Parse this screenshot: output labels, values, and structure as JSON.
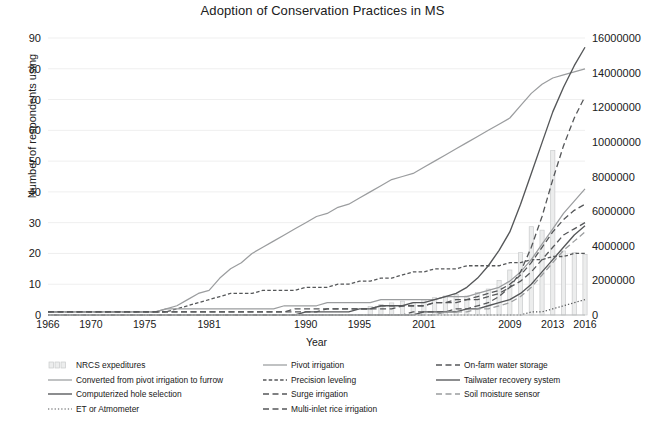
{
  "chart": {
    "title": "Adoption of Conservation Practices in MS",
    "xlabel": "Year",
    "ylabel_left": "Number of respondents using",
    "ylabel_right": ""
  },
  "axes": {
    "y_left_ticks": [
      "0",
      "10",
      "20",
      "30",
      "40",
      "50",
      "60",
      "70",
      "80",
      "90"
    ],
    "y_right_ticks": [
      "0",
      "2000000",
      "4000000",
      "6000000",
      "8000000",
      "10000000",
      "12000000",
      "14000000",
      "16000000"
    ],
    "x_ticks": [
      "1966",
      "1970",
      "1975",
      "1981",
      "1990",
      "1995",
      "2001",
      "2009",
      "2013",
      "2016"
    ]
  },
  "legend": {
    "columns": [
      {
        "items": [
          {
            "label": "NRCS expeditures",
            "style": "bar"
          },
          {
            "label": "Converted from pivot irrigation to furrow",
            "style": "solid-light"
          },
          {
            "label": "Computerized hole selection",
            "style": "solid-dark"
          },
          {
            "label": "ET or Atmometer",
            "style": "dotted"
          }
        ]
      },
      {
        "items": [
          {
            "label": "Pivot irrigation",
            "style": "solid-light"
          },
          {
            "label": "Precision leveling",
            "style": "dash-short"
          },
          {
            "label": "Surge irrigation",
            "style": "dash-long"
          },
          {
            "label": "Multi-inlet rice irrigation",
            "style": "dash-long"
          }
        ]
      },
      {
        "items": [
          {
            "label": "On-farm water storage",
            "style": "dash-long"
          },
          {
            "label": "Tailwater recovery system",
            "style": "solid-dark"
          },
          {
            "label": "Soil moisture sensor",
            "style": "dash-long-light"
          }
        ]
      }
    ]
  },
  "colors": {
    "bar_fill": "#eceded",
    "bar_stroke": "#c9cbcc",
    "line_light": "#9b9d9f",
    "line_dark": "#555759",
    "line_mid": "#6f7173",
    "grid": "#efefef",
    "text": "#202020"
  },
  "chart_data": {
    "type": "line",
    "title": "Adoption of Conservation Practices in MS",
    "xlabel": "Year",
    "ylabel": "Number of respondents using",
    "ylabel_secondary": "NRCS expeditures ($)",
    "ylim": [
      0,
      90
    ],
    "ylim_secondary": [
      0,
      16000000
    ],
    "xlim": [
      1966,
      2016
    ],
    "grid": true,
    "legend_position": "bottom",
    "x": [
      1966,
      1967,
      1968,
      1969,
      1970,
      1971,
      1972,
      1973,
      1974,
      1975,
      1976,
      1977,
      1978,
      1979,
      1980,
      1981,
      1982,
      1983,
      1984,
      1985,
      1986,
      1987,
      1988,
      1989,
      1990,
      1991,
      1992,
      1993,
      1994,
      1995,
      1996,
      1997,
      1998,
      1999,
      2000,
      2001,
      2002,
      2003,
      2004,
      2005,
      2006,
      2007,
      2008,
      2009,
      2010,
      2011,
      2012,
      2013,
      2014,
      2015,
      2016
    ],
    "series": [
      {
        "name": "NRCS expeditures",
        "axis": "secondary",
        "type": "bar",
        "values": [
          0,
          0,
          0,
          0,
          0,
          0,
          0,
          0,
          0,
          0,
          0,
          0,
          0,
          0,
          0,
          0,
          0,
          0,
          0,
          0,
          0,
          0,
          0,
          0,
          0,
          0,
          0,
          0,
          0,
          0,
          500000,
          600000,
          700000,
          800000,
          700000,
          900000,
          1000000,
          1100000,
          1200000,
          1100000,
          1300000,
          1500000,
          2000000,
          2600000,
          3600000,
          5100000,
          4900000,
          9500000,
          3700000,
          3600000,
          3500000
        ]
      },
      {
        "name": "Pivot irrigation",
        "axis": "primary",
        "type": "line",
        "style": "solid-light",
        "values": [
          1,
          1,
          1,
          1,
          1,
          1,
          1,
          1,
          1,
          1,
          1,
          2,
          3,
          5,
          7,
          8,
          12,
          15,
          17,
          20,
          22,
          24,
          26,
          28,
          30,
          32,
          33,
          35,
          36,
          38,
          40,
          42,
          44,
          45,
          46,
          48,
          50,
          52,
          54,
          56,
          58,
          60,
          62,
          64,
          68,
          72,
          75,
          77,
          78,
          79,
          80
        ]
      },
      {
        "name": "Precision leveling",
        "axis": "primary",
        "type": "line",
        "style": "dash-short",
        "values": [
          1,
          1,
          1,
          1,
          1,
          1,
          1,
          1,
          1,
          1,
          1,
          1,
          2,
          3,
          4,
          5,
          6,
          7,
          7,
          7,
          8,
          8,
          8,
          8,
          9,
          9,
          9,
          10,
          10,
          11,
          11,
          12,
          12,
          13,
          14,
          14,
          15,
          15,
          15,
          16,
          16,
          16,
          16,
          17,
          17,
          18,
          18,
          19,
          19,
          20,
          20
        ]
      },
      {
        "name": "Converted from pivot irrigation to furrow",
        "axis": "primary",
        "type": "line",
        "style": "solid-light",
        "values": [
          1,
          1,
          1,
          1,
          1,
          1,
          1,
          1,
          1,
          1,
          1,
          2,
          2,
          2,
          2,
          2,
          2,
          2,
          2,
          2,
          2,
          2,
          3,
          3,
          3,
          3,
          4,
          4,
          4,
          4,
          4,
          5,
          5,
          5,
          5,
          5,
          5,
          6,
          6,
          6,
          7,
          8,
          9,
          11,
          14,
          18,
          23,
          28,
          33,
          37,
          41
        ]
      },
      {
        "name": "Computerized hole selection",
        "axis": "primary",
        "type": "line",
        "style": "solid-dark",
        "values": [
          0,
          0,
          0,
          0,
          0,
          0,
          0,
          0,
          0,
          0,
          0,
          0,
          0,
          0,
          0,
          0,
          0,
          0,
          0,
          0,
          0,
          0,
          0,
          0,
          1,
          1,
          1,
          1,
          1,
          2,
          2,
          3,
          3,
          3,
          4,
          4,
          5,
          6,
          7,
          9,
          12,
          16,
          21,
          27,
          36,
          46,
          56,
          66,
          74,
          81,
          87
        ]
      },
      {
        "name": "Surge irrigation",
        "axis": "primary",
        "type": "line",
        "style": "dash-long",
        "values": [
          1,
          1,
          1,
          1,
          1,
          1,
          1,
          1,
          1,
          1,
          1,
          1,
          1,
          1,
          1,
          1,
          1,
          1,
          1,
          1,
          1,
          1,
          1,
          2,
          2,
          2,
          2,
          2,
          2,
          2,
          2,
          3,
          3,
          3,
          3,
          3,
          4,
          4,
          4,
          5,
          5,
          6,
          7,
          9,
          11,
          14,
          18,
          22,
          26,
          28,
          30
        ]
      },
      {
        "name": "Multi-inlet rice irrigation",
        "axis": "primary",
        "type": "line",
        "style": "dash-long",
        "values": [
          1,
          1,
          1,
          1,
          1,
          1,
          1,
          1,
          1,
          1,
          1,
          1,
          1,
          1,
          1,
          1,
          1,
          1,
          1,
          1,
          1,
          1,
          1,
          1,
          1,
          1,
          2,
          2,
          2,
          2,
          2,
          2,
          2,
          3,
          3,
          3,
          4,
          4,
          5,
          5,
          6,
          7,
          8,
          10,
          13,
          17,
          22,
          27,
          31,
          34,
          36
        ]
      },
      {
        "name": "On-farm water storage",
        "axis": "primary",
        "type": "line",
        "style": "dash-long",
        "values": [
          0,
          0,
          0,
          0,
          0,
          0,
          0,
          0,
          0,
          0,
          0,
          0,
          0,
          0,
          0,
          0,
          0,
          0,
          0,
          0,
          0,
          0,
          0,
          0,
          0,
          0,
          0,
          0,
          0,
          0,
          0,
          0,
          0,
          0,
          1,
          1,
          1,
          1,
          2,
          2,
          3,
          4,
          6,
          9,
          14,
          22,
          32,
          44,
          55,
          64,
          71
        ]
      },
      {
        "name": "Tailwater recovery system",
        "axis": "primary",
        "type": "line",
        "style": "solid-dark",
        "values": [
          0,
          0,
          0,
          0,
          0,
          0,
          0,
          0,
          0,
          0,
          0,
          0,
          0,
          0,
          0,
          0,
          0,
          0,
          0,
          0,
          0,
          0,
          0,
          0,
          0,
          0,
          0,
          0,
          0,
          0,
          0,
          0,
          0,
          0,
          0,
          1,
          1,
          1,
          1,
          2,
          2,
          3,
          4,
          5,
          7,
          10,
          14,
          18,
          22,
          26,
          29
        ]
      },
      {
        "name": "Soil moisture sensor",
        "axis": "primary",
        "type": "line",
        "style": "dash-long-light",
        "values": [
          0,
          0,
          0,
          0,
          0,
          0,
          0,
          0,
          0,
          0,
          0,
          0,
          0,
          0,
          0,
          0,
          0,
          0,
          0,
          0,
          0,
          0,
          0,
          0,
          0,
          0,
          0,
          0,
          0,
          0,
          0,
          0,
          0,
          0,
          0,
          0,
          0,
          1,
          1,
          1,
          2,
          2,
          3,
          4,
          6,
          9,
          13,
          17,
          21,
          24,
          27
        ]
      },
      {
        "name": "ET or Atmometer",
        "axis": "primary",
        "type": "line",
        "style": "dotted",
        "values": [
          0,
          0,
          0,
          0,
          0,
          0,
          0,
          0,
          0,
          0,
          0,
          0,
          0,
          0,
          0,
          0,
          0,
          0,
          0,
          0,
          0,
          0,
          0,
          0,
          0,
          0,
          0,
          0,
          0,
          0,
          0,
          0,
          0,
          0,
          0,
          0,
          0,
          0,
          0,
          0,
          0,
          0,
          0,
          0,
          0,
          1,
          1,
          2,
          3,
          4,
          5
        ]
      }
    ]
  }
}
